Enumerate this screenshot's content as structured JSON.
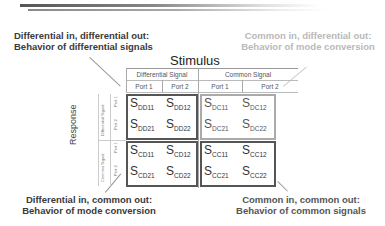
{
  "callouts": {
    "top_left": {
      "line1": "Differential in, differential out:",
      "line2": "Behavior of differential signals"
    },
    "top_right": {
      "line1": "Common in, differential out:",
      "line2": "Behavior of mode conversion"
    },
    "bottom_left": {
      "line1": "Differential in, common out:",
      "line2": "Behavior of mode conversion"
    },
    "bottom_right": {
      "line1": "Common in, common out:",
      "line2": "Behavior of common signals"
    }
  },
  "matrix": {
    "stimulus_label": "Stimulus",
    "response_label": "Response",
    "column_groups": [
      "Differential Signal",
      "Common Signal"
    ],
    "column_ports": [
      "Port 1",
      "Port 2",
      "Port 1",
      "Port 2"
    ],
    "row_groups": [
      "Differential Signal",
      "Common Signal"
    ],
    "row_ports": [
      "Port 1",
      "Port 2",
      "Port 1",
      "Port 2"
    ],
    "cells": {
      "dd11": {
        "s": "S",
        "sub": "DD11"
      },
      "dd12": {
        "s": "S",
        "sub": "DD12"
      },
      "dd21": {
        "s": "S",
        "sub": "DD21"
      },
      "dd22": {
        "s": "S",
        "sub": "DD22"
      },
      "dc11": {
        "s": "S",
        "sub": "DC11"
      },
      "dc12": {
        "s": "S",
        "sub": "DC12"
      },
      "dc21": {
        "s": "S",
        "sub": "DC21"
      },
      "dc22": {
        "s": "S",
        "sub": "DC22"
      },
      "cd11": {
        "s": "S",
        "sub": "CD11"
      },
      "cd12": {
        "s": "S",
        "sub": "CD12"
      },
      "cd21": {
        "s": "S",
        "sub": "CD21"
      },
      "cd22": {
        "s": "S",
        "sub": "CD22"
      },
      "cc11": {
        "s": "S",
        "sub": "CC11"
      },
      "cc12": {
        "s": "S",
        "sub": "CC12"
      },
      "cc21": {
        "s": "S",
        "sub": "CC21"
      },
      "cc22": {
        "s": "S",
        "sub": "CC22"
      }
    }
  }
}
